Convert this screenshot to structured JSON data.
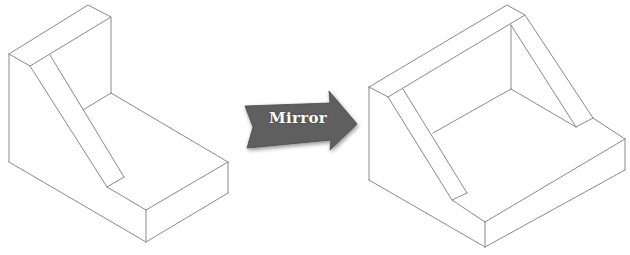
{
  "diagram": {
    "arrow": {
      "label": "Mirror",
      "fill_color": "#5e5e5e",
      "text_color": "#ffffff"
    },
    "shapes": [
      {
        "name": "original-bracket",
        "description": "isometric L-bracket with sloped rib on left"
      },
      {
        "name": "mirrored-bracket",
        "description": "mirrored isometric bracket with sloped ribs on both sides"
      }
    ],
    "line_color": "#8a8a8a"
  }
}
